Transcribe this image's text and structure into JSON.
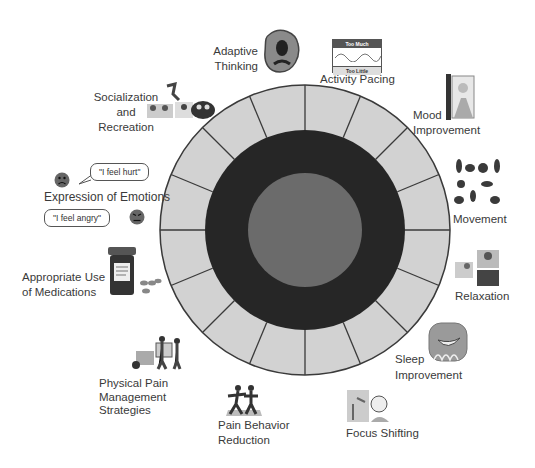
{
  "diagram": {
    "type": "wheel",
    "center": {
      "x": 305,
      "y": 230
    },
    "outer_radius": 145,
    "dark_ring_radius": 100,
    "inner_disc_radius": 57,
    "segment_count": 16,
    "colors": {
      "segment_fill": "#d2d2d2",
      "segment_line": "#3a3a3a",
      "dark_ring": "#262626",
      "inner_disc": "#6b6b6b"
    }
  },
  "labels": {
    "adaptive_thinking": [
      "Adaptive",
      "Thinking"
    ],
    "activity_pacing": "Activity Pacing",
    "activity_pacing_card": {
      "top": "Too Much",
      "bottom": "Too Little"
    },
    "mood_improvement": [
      "Mood",
      "Improvement"
    ],
    "movement": "Movement",
    "relaxation": "Relaxation",
    "sleep_improvement": [
      "Sleep",
      "Improvement"
    ],
    "focus_shifting": "Focus Shifting",
    "pain_behavior_reduction": [
      "Pain Behavior",
      "Reduction"
    ],
    "physical_pain_management": [
      "Physical Pain",
      "Management",
      "Strategies"
    ],
    "appropriate_use_medications": [
      "Appropriate Use",
      "of Medications"
    ],
    "expression_of_emotions": "Expression of Emotions",
    "bubble_hurt": "\"I feel hurt\"",
    "bubble_angry": "\"I feel angry\"",
    "socialization_recreation": [
      "Socialization",
      "and",
      "Recreation"
    ]
  }
}
